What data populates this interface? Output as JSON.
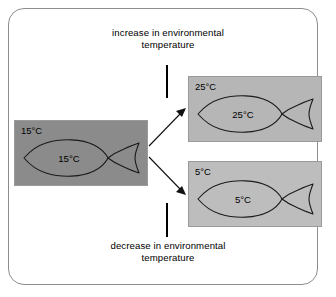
{
  "diagram": {
    "captions": {
      "top": "increase in environmental temperature",
      "bottom": "decrease in environmental temperature"
    },
    "boxes": {
      "source": {
        "corner_label": "15°C",
        "fish_label": "15°C",
        "fill": "#8b8b8b",
        "name": "starting-condition"
      },
      "warm": {
        "corner_label": "25°C",
        "fish_label": "25°C",
        "fill": "#b6b6b6",
        "name": "warmer-environment"
      },
      "cool": {
        "corner_label": "5°C",
        "fish_label": "5°C",
        "fill": "#bdbdbd",
        "name": "cooler-environment"
      }
    },
    "icons": {
      "fish": "fish-icon",
      "arrow_up": "arrow-to-warm-icon",
      "arrow_down": "arrow-to-cool-icon"
    },
    "colors": {
      "frame_border": "#8d8d8d",
      "stroke": "#111111",
      "text": "#000000",
      "background": "#ffffff"
    }
  }
}
